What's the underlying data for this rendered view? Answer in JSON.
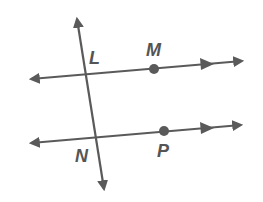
{
  "diagram": {
    "colors": {
      "stroke": "#5a5a5a",
      "background": "#ffffff"
    },
    "points": [
      {
        "name": "L",
        "x": 95,
        "y": 64
      },
      {
        "name": "M",
        "x": 153,
        "y": 56
      },
      {
        "name": "N",
        "x": 83,
        "y": 162
      },
      {
        "name": "P",
        "x": 163,
        "y": 157
      }
    ],
    "lines": [
      {
        "id": "upper",
        "from": [
          30,
          79
        ],
        "to": [
          243,
          61
        ],
        "parallel_marks": 1
      },
      {
        "id": "lower",
        "from": [
          30,
          143
        ],
        "to": [
          241,
          125
        ],
        "parallel_marks": 1
      },
      {
        "id": "transversal",
        "from": [
          77,
          18
        ],
        "to": [
          104,
          190
        ]
      }
    ],
    "dots": [
      {
        "label": "M",
        "x": 154,
        "y": 69
      },
      {
        "label": "P",
        "x": 164,
        "y": 131
      }
    ]
  }
}
